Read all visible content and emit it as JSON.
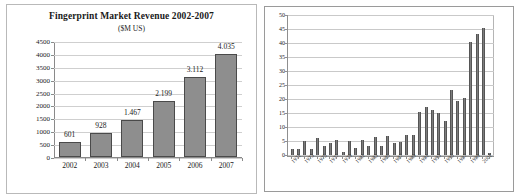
{
  "chart_data": [
    {
      "type": "bar",
      "id": "fingerprint-market-revenue",
      "title": "Fingerprint Market Revenue 2002-2007",
      "subtitle": "($M US)",
      "xlabel": "",
      "ylabel": "",
      "ylim": [
        0,
        4500
      ],
      "yticks": [
        0,
        500,
        1000,
        1500,
        2000,
        2500,
        3000,
        3500,
        4000,
        4500
      ],
      "ytick_labels": [
        "0",
        "500",
        "1000",
        "1500",
        "2000",
        "2500",
        "3000",
        "3500",
        "4000",
        "4500"
      ],
      "grid": true,
      "legend": "none",
      "categories": [
        "2002",
        "2003",
        "2004",
        "2005",
        "2006",
        "2007"
      ],
      "values": [
        601,
        928,
        1467,
        2199,
        3112,
        4035
      ],
      "data_labels": [
        "601",
        "928",
        "1.467",
        "2.199",
        "3.112",
        "4.035"
      ],
      "bar_color": "#8e8e8e",
      "bar_border_color": "#4a4a4a"
    },
    {
      "type": "bar",
      "id": "yearly-counts-1971-2002",
      "title": "",
      "subtitle": "",
      "xlabel": "",
      "ylabel": "",
      "ylim": [
        0,
        50
      ],
      "yticks": [
        0,
        5,
        10,
        15,
        20,
        25,
        30,
        35,
        40,
        45,
        50
      ],
      "ytick_labels": [
        "0",
        "5",
        "10",
        "15",
        "20",
        "25",
        "30",
        "35",
        "40",
        "45",
        "50"
      ],
      "grid": true,
      "legend": "none",
      "categories": [
        "1971",
        "1972",
        "1973",
        "1974",
        "1975",
        "1976",
        "1977",
        "1978",
        "1979",
        "1980",
        "1981",
        "1982",
        "1983",
        "1984",
        "1985",
        "1986",
        "1987",
        "1988",
        "1989",
        "1990",
        "1991",
        "1992",
        "1993",
        "1994",
        "1995",
        "1996",
        "1997",
        "1998",
        "1999",
        "2000",
        "2001",
        "2002"
      ],
      "tick_labels_shown": [
        "1971",
        "1973",
        "1975",
        "1977",
        "1979",
        "1981",
        "1983",
        "1985",
        "1987",
        "1989",
        "1991",
        "1993",
        "1995",
        "1997",
        "1999",
        "2001"
      ],
      "values": [
        2.2,
        2.3,
        5.1,
        2.2,
        6.1,
        3.3,
        4.2,
        5.2,
        1.2,
        5.1,
        2.4,
        5.2,
        3.2,
        6.3,
        3.3,
        6.9,
        4.3,
        4.5,
        7.1,
        7.2,
        15.2,
        17.2,
        16.1,
        15.1,
        12.3,
        23.2,
        19.2,
        20.3,
        40.2,
        43.2,
        45.2,
        0.6
      ],
      "bar_color": "#7d7d7d",
      "bar_border_color": "#555555"
    }
  ]
}
